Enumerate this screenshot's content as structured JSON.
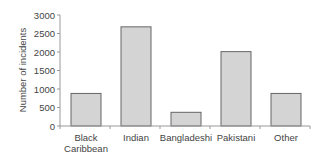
{
  "chart_data": {
    "type": "bar",
    "title": "",
    "xlabel": "",
    "ylabel": "Number of incidents",
    "categories": [
      "Black Caribbean",
      "Indian",
      "Bangladeshi",
      "Pakistani",
      "Other"
    ],
    "category_label_lines": [
      [
        "Black",
        "Caribbean"
      ],
      [
        "Indian"
      ],
      [
        "Bangladeshi"
      ],
      [
        "Pakistani"
      ],
      [
        "Other"
      ]
    ],
    "values": [
      880,
      2680,
      370,
      2010,
      880
    ],
    "ylim": [
      0,
      3000
    ],
    "yticks": [
      0,
      500,
      1000,
      1500,
      2000,
      2500,
      3000
    ],
    "grid": false,
    "legend": null,
    "colors": {
      "bar_fill": "#d4d4d4",
      "bar_stroke": "#666666",
      "axis": "#999999"
    }
  }
}
